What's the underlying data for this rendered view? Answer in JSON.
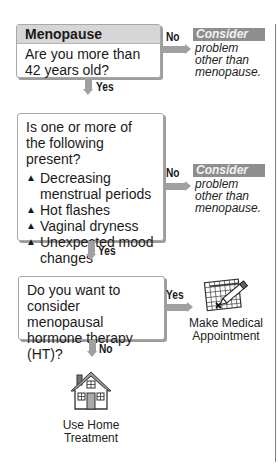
{
  "flowchart": {
    "step1": {
      "title": "Menopause",
      "question": "Are you more than 42 years old?",
      "no_label": "No",
      "yes_label": "Yes",
      "no_outcome": {
        "tag": "Consider",
        "text": "problem other than menopause."
      }
    },
    "step2": {
      "question": "Is one or more of the following present?",
      "symptoms": [
        "Decreasing menstrual periods",
        "Hot flashes",
        "Vaginal dryness",
        "Unexpected mood changes"
      ],
      "bullet_icon": "triangle-bullet-icon",
      "no_label": "No",
      "yes_label": "Yes",
      "no_outcome": {
        "tag": "Consider",
        "text": "problem other than menopause."
      }
    },
    "step3": {
      "question": "Do you want to consider menopausal hormone therapy (HT)?",
      "yes_label": "Yes",
      "no_label": "No",
      "yes_outcome": {
        "icon": "calendar-pencil-icon",
        "caption_line1": "Make Medical",
        "caption_line2": "Appointment"
      },
      "no_outcome": {
        "icon": "house-icon",
        "caption_line1": "Use Home",
        "caption_line2": "Treatment"
      }
    }
  },
  "colors": {
    "arrow": "#a0a0a0",
    "header_band": "#d6d6d6",
    "consider_tag": "#8e8e8e"
  }
}
